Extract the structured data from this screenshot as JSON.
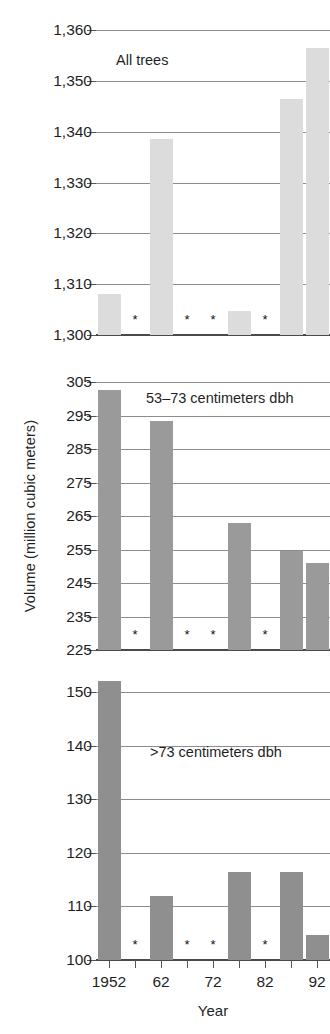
{
  "figure": {
    "ylabel": "Volume (million cubic meters)",
    "xlabel": "Year",
    "footnote_symbol": "*"
  },
  "axis": {
    "x_tick_labels": [
      "1952",
      "62",
      "72",
      "82",
      "92"
    ],
    "bar_color_all": "#dcdcdc",
    "bar_color_mid": "#9a9a9a",
    "bar_color_large": "#8f8f8f"
  },
  "chart_data": [
    {
      "type": "bar",
      "title": "All trees",
      "panel": "top",
      "xlabel": "Year",
      "ylabel": "Volume (million cubic meters)",
      "categories": [
        "1952",
        "1957",
        "1962",
        "1967",
        "1972",
        "1977",
        "1982",
        "1987",
        "1992"
      ],
      "x_tick_labels": [
        "1952",
        "62",
        "72",
        "82",
        "92"
      ],
      "values": [
        1308,
        null,
        1338.5,
        null,
        null,
        1304.8,
        null,
        1346.5,
        1356.5
      ],
      "missing_marker": "*",
      "missing_indices": [
        1,
        3,
        4,
        6
      ],
      "ylim": [
        1300,
        1360
      ],
      "yticks": [
        "1,300",
        "1,310",
        "1,320",
        "1,330",
        "1,340",
        "1,350",
        "1,360"
      ],
      "ytick_values": [
        1300,
        1310,
        1320,
        1330,
        1340,
        1350,
        1360
      ],
      "grid": true,
      "legend": "none",
      "color": "#dcdcdc"
    },
    {
      "type": "bar",
      "title": "53–73 centimeters dbh",
      "panel": "middle",
      "xlabel": "Year",
      "ylabel": "Volume (million cubic meters)",
      "categories": [
        "1952",
        "1957",
        "1962",
        "1967",
        "1972",
        "1977",
        "1982",
        "1987",
        "1992"
      ],
      "x_tick_labels": [
        "1952",
        "62",
        "72",
        "82",
        "92"
      ],
      "values": [
        302.5,
        null,
        293.5,
        null,
        null,
        263.0,
        null,
        254.6,
        251.0
      ],
      "missing_marker": "*",
      "missing_indices": [
        1,
        3,
        4,
        6
      ],
      "ylim": [
        225,
        305
      ],
      "yticks": [
        "225",
        "235",
        "245",
        "255",
        "265",
        "275",
        "285",
        "295",
        "305"
      ],
      "ytick_values": [
        225,
        235,
        245,
        255,
        265,
        275,
        285,
        295,
        305
      ],
      "grid": true,
      "legend": "none",
      "color": "#9a9a9a"
    },
    {
      "type": "bar",
      "title": ">73 centimeters dbh",
      "panel": "bottom",
      "xlabel": "Year",
      "ylabel": "Volume (million cubic meters)",
      "categories": [
        "1952",
        "1957",
        "1962",
        "1967",
        "1972",
        "1977",
        "1982",
        "1987",
        "1992"
      ],
      "x_tick_labels": [
        "1952",
        "62",
        "72",
        "82",
        "92"
      ],
      "values": [
        152.0,
        null,
        112.0,
        null,
        null,
        116.5,
        null,
        116.5,
        104.7
      ],
      "missing_marker": "*",
      "missing_indices": [
        1,
        3,
        4,
        6
      ],
      "ylim": [
        100,
        150
      ],
      "yticks": [
        "100",
        "110",
        "120",
        "130",
        "140",
        "150"
      ],
      "ytick_values": [
        100,
        110,
        120,
        130,
        140,
        150
      ],
      "grid": true,
      "legend": "none",
      "color": "#8f8f8f"
    }
  ]
}
